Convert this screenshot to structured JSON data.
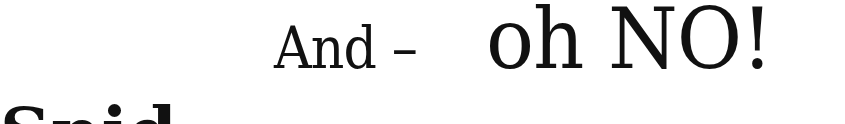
{
  "page": {
    "line1": {
      "lead": "And –",
      "emphasis": "oh NO!"
    },
    "line2_partial": "Snid"
  }
}
